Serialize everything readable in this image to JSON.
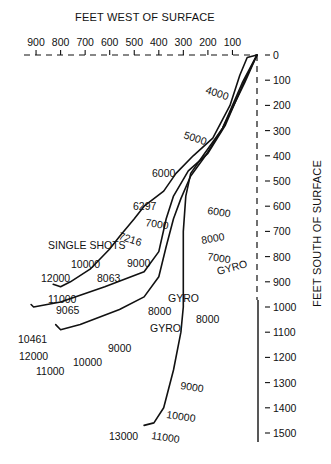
{
  "chart_data": {
    "type": "line",
    "title_top": "FEET WEST OF SURFACE",
    "title_right": "FEET SOUTH OF SURFACE",
    "xlabel": "FEET WEST OF SURFACE",
    "ylabel": "FEET SOUTH OF SURFACE",
    "x_ticks": [
      900,
      800,
      700,
      600,
      500,
      400,
      300,
      200,
      100
    ],
    "y_ticks": [
      0,
      100,
      200,
      300,
      400,
      500,
      600,
      700,
      800,
      900,
      1000,
      1100,
      1200,
      1300,
      1400,
      1500
    ],
    "xlim": [
      0,
      1000
    ],
    "ylim": [
      0,
      1500
    ],
    "grid": false,
    "series": [
      {
        "name": "Single Shots",
        "points_west_south": [
          [
            0,
            0
          ],
          [
            40,
            10
          ],
          [
            70,
            80
          ],
          [
            110,
            200
          ],
          [
            180,
            330
          ],
          [
            260,
            400
          ],
          [
            330,
            470
          ],
          [
            380,
            540
          ],
          [
            460,
            600
          ],
          [
            500,
            650
          ],
          [
            560,
            720
          ],
          [
            600,
            770
          ],
          [
            680,
            850
          ],
          [
            760,
            900
          ],
          [
            800,
            920
          ],
          [
            830,
            910
          ]
        ],
        "depth_markers": [
          "4000",
          "5000",
          "6000",
          "6297",
          "7216",
          "8063",
          "10000",
          "11000",
          "12000"
        ]
      },
      {
        "name": "Gyro (A)",
        "points_west_south": [
          [
            0,
            0
          ],
          [
            50,
            100
          ],
          [
            130,
            280
          ],
          [
            200,
            390
          ],
          [
            280,
            460
          ],
          [
            340,
            560
          ],
          [
            370,
            650
          ],
          [
            400,
            780
          ],
          [
            460,
            860
          ],
          [
            620,
            920
          ],
          [
            800,
            980
          ],
          [
            910,
            1000
          ],
          [
            920,
            990
          ]
        ],
        "depth_markers": [
          "6000",
          "7000",
          "9000",
          "9065",
          "10461"
        ]
      },
      {
        "name": "Gyro (B)",
        "points_west_south": [
          [
            0,
            0
          ],
          [
            50,
            110
          ],
          [
            140,
            290
          ],
          [
            210,
            400
          ],
          [
            270,
            480
          ],
          [
            310,
            570
          ],
          [
            340,
            650
          ],
          [
            370,
            760
          ],
          [
            400,
            880
          ],
          [
            460,
            960
          ],
          [
            560,
            1010
          ],
          [
            720,
            1070
          ],
          [
            800,
            1090
          ],
          [
            820,
            1070
          ]
        ],
        "depth_markers": [
          "7000",
          "8000",
          "9000",
          "10000",
          "11000",
          "12000"
        ]
      },
      {
        "name": "Gyro (C)",
        "points_west_south": [
          [
            0,
            0
          ],
          [
            60,
            110
          ],
          [
            140,
            290
          ],
          [
            220,
            400
          ],
          [
            270,
            470
          ],
          [
            290,
            560
          ],
          [
            300,
            700
          ],
          [
            300,
            860
          ],
          [
            300,
            1000
          ],
          [
            310,
            1100
          ],
          [
            340,
            1250
          ],
          [
            380,
            1400
          ],
          [
            420,
            1460
          ],
          [
            460,
            1470
          ]
        ],
        "depth_markers": [
          "8000",
          "8000",
          "9000",
          "10000",
          "11000",
          "13000"
        ]
      }
    ],
    "annotations": [
      {
        "text": "4000",
        "x": 205,
        "y": 93,
        "rot": 18
      },
      {
        "text": "5000",
        "x": 183,
        "y": 138,
        "rot": 18
      },
      {
        "text": "6000",
        "x": 152,
        "y": 177,
        "rot": 0
      },
      {
        "text": "6297",
        "x": 133,
        "y": 210,
        "rot": 0
      },
      {
        "text": "6000",
        "x": 207,
        "y": 214,
        "rot": 8
      },
      {
        "text": "7000",
        "x": 145,
        "y": 226,
        "rot": 8
      },
      {
        "text": "7216",
        "x": 118,
        "y": 239,
        "rot": 18
      },
      {
        "text": "8000",
        "x": 202,
        "y": 244,
        "rot": -10
      },
      {
        "text": "SINGLE SHOTS",
        "x": 48,
        "y": 249,
        "rot": 0
      },
      {
        "text": "7000",
        "x": 207,
        "y": 260,
        "rot": 8
      },
      {
        "text": "GYRO",
        "x": 218,
        "y": 275,
        "rot": -15
      },
      {
        "text": "10000",
        "x": 71,
        "y": 268,
        "rot": 0
      },
      {
        "text": "9000",
        "x": 127,
        "y": 267,
        "rot": 0
      },
      {
        "text": "12000",
        "x": 41,
        "y": 282,
        "rot": 0
      },
      {
        "text": "8063",
        "x": 97,
        "y": 282,
        "rot": 0
      },
      {
        "text": "11000",
        "x": 48,
        "y": 303,
        "rot": 0
      },
      {
        "text": "GYRO",
        "x": 168,
        "y": 302,
        "rot": 0
      },
      {
        "text": "9065",
        "x": 56,
        "y": 314,
        "rot": 0
      },
      {
        "text": "8000",
        "x": 148,
        "y": 315,
        "rot": 0
      },
      {
        "text": "GYRO",
        "x": 150,
        "y": 332,
        "rot": 0
      },
      {
        "text": "8000",
        "x": 196,
        "y": 323,
        "rot": 0
      },
      {
        "text": "10461",
        "x": 18,
        "y": 343,
        "rot": 0
      },
      {
        "text": "9000",
        "x": 108,
        "y": 352,
        "rot": 0
      },
      {
        "text": "12000",
        "x": 19,
        "y": 360,
        "rot": 0
      },
      {
        "text": "10000",
        "x": 73,
        "y": 366,
        "rot": 0
      },
      {
        "text": "11000",
        "x": 36,
        "y": 375,
        "rot": 0
      },
      {
        "text": "9000",
        "x": 180,
        "y": 389,
        "rot": 8
      },
      {
        "text": "10000",
        "x": 166,
        "y": 418,
        "rot": 8
      },
      {
        "text": "13000",
        "x": 109,
        "y": 440,
        "rot": 0
      },
      {
        "text": "11000",
        "x": 151,
        "y": 439,
        "rot": 8
      }
    ]
  },
  "labels": {
    "title_top": "FEET WEST OF SURFACE",
    "title_right": "FEET SOUTH OF SURFACE"
  }
}
